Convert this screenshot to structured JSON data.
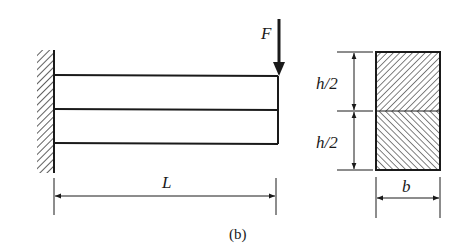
{
  "figure": {
    "caption": "(b)",
    "beam_view": {
      "description": "cantilever beam of two stacked layers, fixed at left wall, point load at free end",
      "load_label": "F",
      "length_label": "L",
      "layers": 2,
      "support": "fixed-wall-hatched"
    },
    "cross_section": {
      "description": "rectangular cross-section split into two halves with opposite hatching",
      "height_labels": [
        "h/2",
        "h/2"
      ],
      "width_label": "b",
      "top_hatch": "diagonal-forward",
      "bottom_hatch": "diagonal-backward"
    }
  },
  "colors": {
    "line": "#1a1a1a",
    "background": "#ffffff"
  }
}
